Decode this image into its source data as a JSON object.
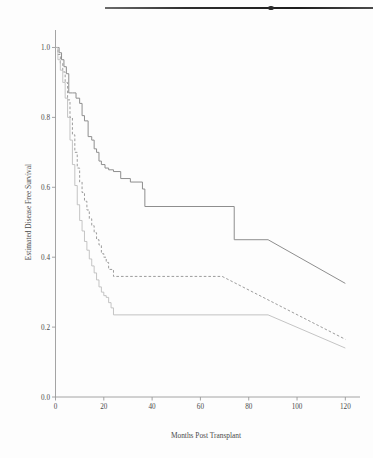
{
  "figure": {
    "artifact": "scanned-page-edge-line"
  },
  "chart_data": {
    "type": "line",
    "title": "",
    "xlabel": "Months Post Transplant",
    "ylabel": "Estimated Disease Free Survival",
    "xlim": [
      0,
      124
    ],
    "ylim": [
      0.0,
      1.05
    ],
    "grid": false,
    "legend": "none",
    "xticks": [
      0,
      20,
      40,
      60,
      80,
      100,
      120
    ],
    "xtick_labels": [
      "0",
      "20",
      "40",
      "60",
      "80",
      "100",
      "120"
    ],
    "yticks": [
      0.0,
      0.2,
      0.4,
      0.6,
      0.8,
      1.0
    ],
    "ytick_labels": [
      "0.0",
      "0.2",
      "0.4",
      "0.6",
      "0.8",
      "1.0"
    ],
    "series": [
      {
        "name": "upper-curve",
        "style": "solid",
        "color": "#8e8e8e",
        "step": "post",
        "x": [
          0,
          1.5,
          2.5,
          3.5,
          4.5,
          5.5,
          7,
          8.5,
          10,
          11,
          12,
          13.5,
          15,
          16,
          17,
          18,
          19,
          20.5,
          22,
          24,
          27,
          31,
          36,
          37,
          74,
          88,
          120
        ],
        "y": [
          1.0,
          0.985,
          0.965,
          0.945,
          0.925,
          0.87,
          0.87,
          0.855,
          0.84,
          0.805,
          0.79,
          0.745,
          0.735,
          0.71,
          0.7,
          0.675,
          0.665,
          0.655,
          0.65,
          0.645,
          0.625,
          0.615,
          0.595,
          0.545,
          0.45,
          0.45,
          0.325
        ]
      },
      {
        "name": "middle-curve",
        "style": "dashed",
        "color": "#9c9c9c",
        "step": "post",
        "x": [
          0,
          1,
          2,
          3,
          4,
          5,
          6,
          7,
          8,
          9,
          10,
          11,
          12,
          13,
          14,
          15,
          16,
          17,
          18,
          19,
          20,
          21,
          22,
          24,
          69,
          120
        ],
        "y": [
          1.0,
          0.98,
          0.955,
          0.93,
          0.9,
          0.85,
          0.8,
          0.75,
          0.7,
          0.655,
          0.615,
          0.585,
          0.56,
          0.535,
          0.51,
          0.49,
          0.47,
          0.45,
          0.435,
          0.41,
          0.4,
          0.385,
          0.365,
          0.345,
          0.345,
          0.165
        ]
      },
      {
        "name": "lower-curve",
        "style": "solid-thin",
        "color": "#bdbdbd",
        "step": "post",
        "x": [
          0,
          1,
          2,
          3,
          4,
          5,
          6,
          7,
          8,
          9,
          10,
          11,
          12,
          13,
          14,
          15,
          16,
          17,
          18,
          19,
          20,
          21,
          22,
          23,
          24,
          88,
          120
        ],
        "y": [
          1.0,
          0.965,
          0.935,
          0.9,
          0.855,
          0.8,
          0.735,
          0.665,
          0.605,
          0.55,
          0.505,
          0.475,
          0.445,
          0.42,
          0.395,
          0.375,
          0.355,
          0.335,
          0.315,
          0.3,
          0.29,
          0.285,
          0.27,
          0.255,
          0.235,
          0.235,
          0.14
        ]
      }
    ]
  }
}
